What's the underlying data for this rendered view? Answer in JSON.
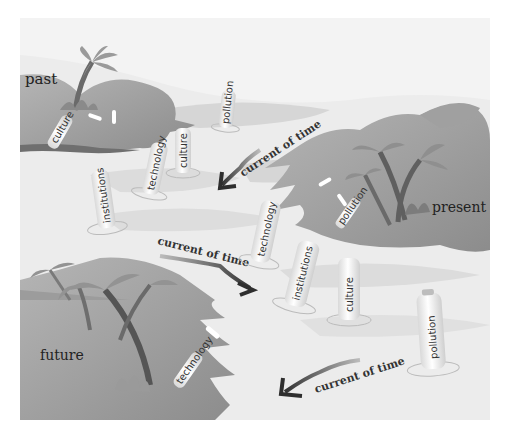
{
  "scene": {
    "description": "Islands in a sea with message bottles drifting along the current of time",
    "colors": {
      "background": "#ffffff",
      "sea": "#e6e6e6",
      "sea_shadow": "#cfcfcf",
      "island_light": "#a9a9a9",
      "island_dark": "#7e7e7e",
      "bottle": "#f4f4f4",
      "text": "#222222"
    }
  },
  "islands": {
    "past": {
      "label": "past"
    },
    "present": {
      "label": "present"
    },
    "future": {
      "label": "future"
    }
  },
  "currents": [
    {
      "label": "current of time"
    },
    {
      "label": "current of time"
    },
    {
      "label": "current of time"
    }
  ],
  "bottles": {
    "past_island": [
      {
        "label": "culture"
      }
    ],
    "sea_upper": [
      {
        "label": "pollution"
      },
      {
        "label": "culture"
      },
      {
        "label": "technology"
      },
      {
        "label": "institutions"
      }
    ],
    "present_island": [
      {
        "label": "pollution"
      }
    ],
    "sea_middle": [
      {
        "label": "technology"
      },
      {
        "label": "institutions"
      },
      {
        "label": "culture"
      },
      {
        "label": "pollution"
      }
    ],
    "future_island": [
      {
        "label": "technology"
      }
    ]
  }
}
